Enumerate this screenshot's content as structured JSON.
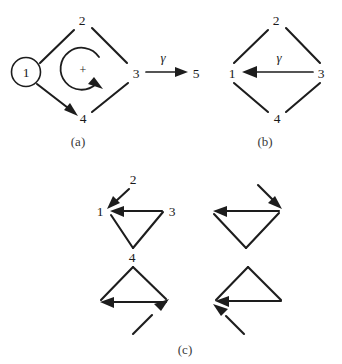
{
  "figure": {
    "background_color": "#ffffff",
    "line_color": "#1d1d1a",
    "panels": [
      {
        "id": "a",
        "caption": "(a)",
        "caption_x": 78,
        "caption_y": 142,
        "description": "Diamond graph with circled node 1, internal circular plus-arrow, and gamma edge from node 3 to node 5",
        "nodes": [
          {
            "name": "1",
            "label": "1",
            "x": 26,
            "y": 72,
            "circled": true
          },
          {
            "name": "2",
            "label": "2",
            "x": 82,
            "y": 20,
            "circled": false
          },
          {
            "name": "3",
            "label": "3",
            "x": 136,
            "y": 73,
            "circled": false
          },
          {
            "name": "4",
            "label": "4",
            "x": 83,
            "y": 118,
            "circled": false
          },
          {
            "name": "5",
            "label": "5",
            "x": 196,
            "y": 73,
            "circled": false
          }
        ],
        "edges": [
          {
            "from": "1",
            "to": "2",
            "arrow": false
          },
          {
            "from": "2",
            "to": "3",
            "arrow": false
          },
          {
            "from": "1",
            "to": "4",
            "arrow": true
          },
          {
            "from": "4",
            "to": "3",
            "arrow": false
          },
          {
            "from": "3",
            "to": "5",
            "arrow": true,
            "label": "γ"
          }
        ],
        "circular_arrow": {
          "label": "+",
          "sense": "clockwise",
          "cx": 83,
          "cy": 69,
          "r": 21
        },
        "gamma_label": "γ",
        "gamma_label_x": 163,
        "gamma_label_y": 58
      },
      {
        "id": "b",
        "caption": "(b)",
        "caption_x": 265,
        "caption_y": 142,
        "description": "Diamond graph with horizontal gamma arrow from node 3 to node 1",
        "nodes": [
          {
            "name": "1",
            "label": "1",
            "x": 232,
            "y": 73,
            "circled": false
          },
          {
            "name": "2",
            "label": "2",
            "x": 276,
            "y": 20,
            "circled": false
          },
          {
            "name": "3",
            "label": "3",
            "x": 321,
            "y": 73,
            "circled": false
          },
          {
            "name": "4",
            "label": "4",
            "x": 277,
            "y": 118,
            "circled": false
          }
        ],
        "edges": [
          {
            "from": "1",
            "to": "2",
            "arrow": false
          },
          {
            "from": "2",
            "to": "3",
            "arrow": false
          },
          {
            "from": "1",
            "to": "4",
            "arrow": false
          },
          {
            "from": "4",
            "to": "3",
            "arrow": false
          },
          {
            "from": "3",
            "to": "1",
            "arrow": true,
            "label": "γ"
          }
        ],
        "gamma_label": "γ",
        "gamma_label_x": 279,
        "gamma_label_y": 58
      },
      {
        "id": "c",
        "caption": "(c)",
        "caption_x": 185,
        "caption_y": 350,
        "description": "Four small triangle motifs showing incoming arrow orientations",
        "subfigures": [
          {
            "name": "top-left",
            "labeled": true,
            "triangle_orientation": "down",
            "node_labels": [
              {
                "label": "1",
                "x": 102,
                "y": 212
              },
              {
                "label": "2",
                "x": 131,
                "y": 180
              },
              {
                "label": "3",
                "x": 170,
                "y": 212
              },
              {
                "label": "4",
                "x": 131,
                "y": 255
              }
            ],
            "arrows": [
              {
                "from": "2",
                "to": "1",
                "direction": "down-left"
              },
              {
                "from": "3",
                "to": "1",
                "direction": "left"
              }
            ]
          },
          {
            "name": "top-right",
            "labeled": false,
            "triangle_orientation": "down",
            "arrows": [
              {
                "direction": "down-right",
                "target": "right-vertex"
              },
              {
                "direction": "left",
                "target": "left-vertex"
              }
            ]
          },
          {
            "name": "bottom-left",
            "labeled": false,
            "triangle_orientation": "up",
            "arrows": [
              {
                "direction": "up-right",
                "target": "right-vertex"
              },
              {
                "direction": "left",
                "target": "left-vertex"
              }
            ]
          },
          {
            "name": "bottom-right",
            "labeled": false,
            "triangle_orientation": "up",
            "arrows": [
              {
                "direction": "up-left",
                "target": "left-vertex"
              },
              {
                "direction": "left",
                "target": "left-vertex"
              }
            ]
          }
        ]
      }
    ]
  }
}
